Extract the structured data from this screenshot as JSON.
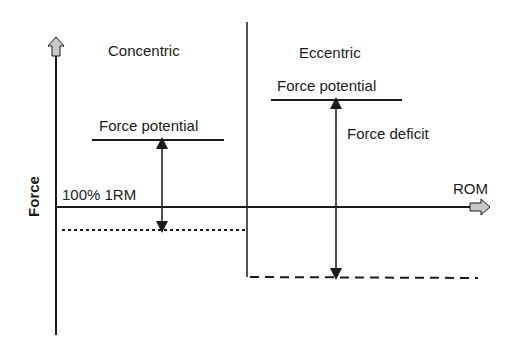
{
  "diagram": {
    "sections": {
      "left": {
        "title": "Concentric",
        "force_potential_label": "Force potential",
        "baseline_label": "100% 1RM"
      },
      "right": {
        "title": "Eccentric",
        "force_potential_label": "Force potential",
        "deficit_label": "Force deficit"
      }
    },
    "axes": {
      "y_label": "Force",
      "x_label": "ROM"
    },
    "colors": {
      "line": "#1a1a1a",
      "arrow_fill": "#c8c8c8"
    }
  }
}
